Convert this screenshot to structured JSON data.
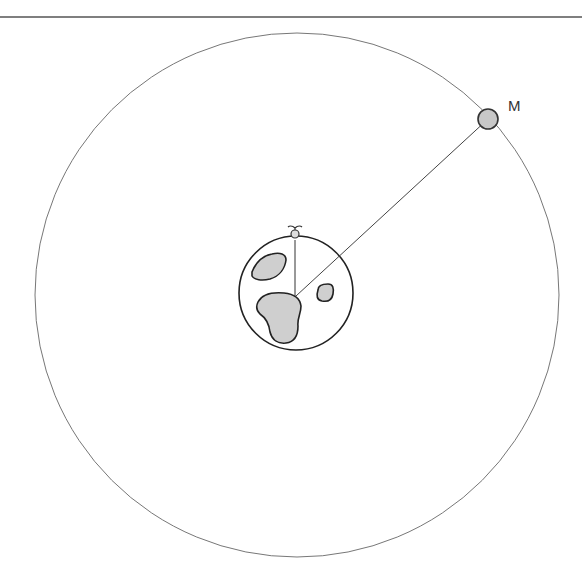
{
  "diagram": {
    "type": "earth-moon-orbit",
    "top_rule": {
      "y": 17,
      "color": "#555555"
    },
    "orbit": {
      "cx": 297,
      "cy": 295,
      "r": 262,
      "stroke": "#777777"
    },
    "earth": {
      "cx": 296,
      "cy": 293,
      "r": 57,
      "stroke": "#222222",
      "fill": "#ffffff",
      "continent_fill": "#cfcfcf"
    },
    "moon": {
      "cx": 488,
      "cy": 119,
      "r": 10,
      "fill": "#c8c8c8",
      "stroke": "#333333"
    },
    "moon_label": "M",
    "observer": {
      "x": 295,
      "y": 233
    },
    "earth_moon_line": {
      "x1": 296,
      "y1": 296,
      "x2": 488,
      "y2": 119
    },
    "observer_line": {
      "x1": 295,
      "y1": 240,
      "x2": 295,
      "y2": 296
    }
  }
}
